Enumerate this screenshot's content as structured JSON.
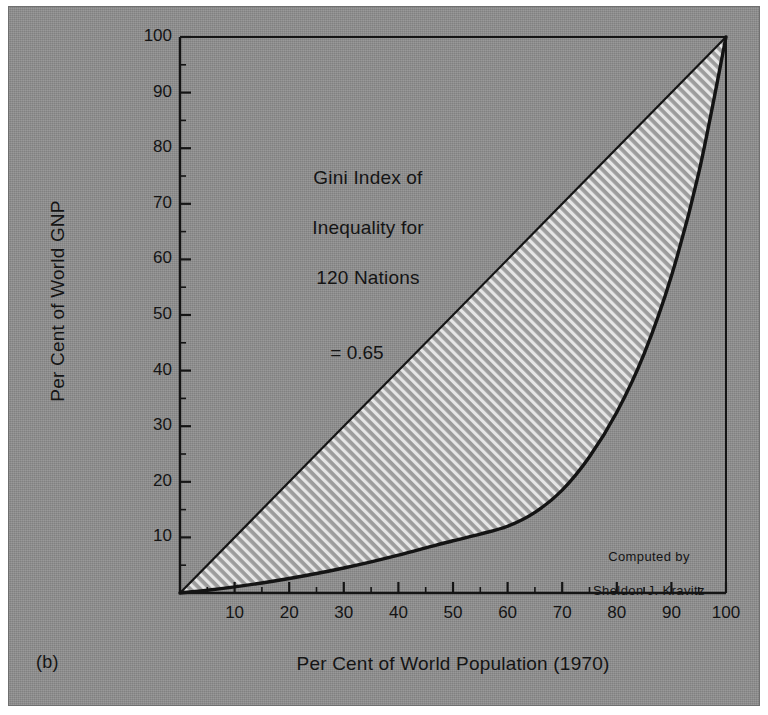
{
  "figure": {
    "panel_label": "(b)",
    "background_color": "#8e8e8e",
    "ink_color": "#141414"
  },
  "annotations": {
    "gini_line1": "Gini Index of",
    "gini_line2": "Inequality for",
    "gini_line3": "120 Nations",
    "gini_line4": "= 0.65",
    "credit_line1": "Computed by",
    "credit_line2": "Sheldon J. Kravitz"
  },
  "chart_data": {
    "type": "line",
    "title": "",
    "subtitle": "",
    "xlabel": "Per Cent of World Population (1970)",
    "ylabel": "Per Cent of World GNP",
    "xlim": [
      0,
      100
    ],
    "ylim": [
      0,
      100
    ],
    "grid": false,
    "legend_position": "none",
    "xticks": [
      10,
      20,
      30,
      40,
      50,
      60,
      70,
      80,
      90,
      100
    ],
    "yticks": [
      10,
      20,
      30,
      40,
      50,
      60,
      70,
      80,
      90,
      100
    ],
    "xtick_labels": [
      "10",
      "20",
      "30",
      "40",
      "50",
      "60",
      "70",
      "80",
      "90",
      "100"
    ],
    "ytick_labels": [
      "10",
      "20",
      "30",
      "40",
      "50",
      "60",
      "70",
      "80",
      "90",
      "100"
    ],
    "minor_tick_interval": 5,
    "gini_index": 0.65,
    "series": [
      {
        "name": "Line of equality",
        "style": "straight",
        "x": [
          0,
          100
        ],
        "values": [
          0,
          100
        ]
      },
      {
        "name": "Lorenz curve",
        "style": "curve",
        "x": [
          0,
          5,
          10,
          15,
          20,
          25,
          30,
          35,
          40,
          45,
          50,
          55,
          60,
          65,
          70,
          75,
          80,
          85,
          90,
          95,
          100
        ],
        "values": [
          0,
          0.5,
          1.1,
          1.8,
          2.6,
          3.5,
          4.5,
          5.6,
          6.8,
          8.1,
          9.4,
          10.6,
          12.0,
          14.5,
          18.5,
          24.5,
          32.5,
          43.0,
          57.0,
          75.5,
          100
        ]
      }
    ],
    "shaded_region": {
      "name": "area-of-inequality",
      "fill": "diagonal-hatch",
      "between": [
        "Line of equality",
        "Lorenz curve"
      ]
    }
  }
}
